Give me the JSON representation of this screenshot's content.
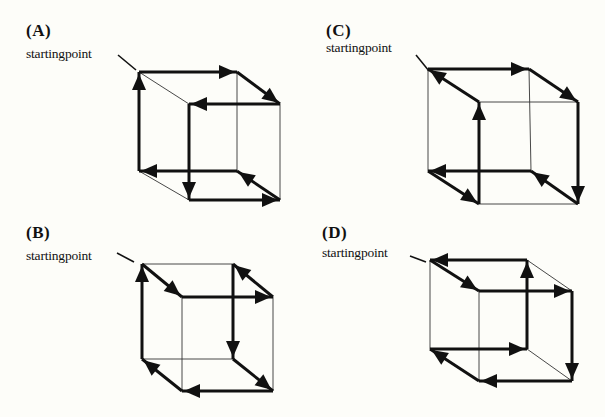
{
  "panels": [
    {
      "id": "A",
      "label": "(A)",
      "start_text": "startingpoint",
      "label_pos": [
        26,
        22
      ],
      "start_pos": [
        26,
        47
      ],
      "pointer": [
        [
          118,
          55
        ],
        [
          136,
          70
        ]
      ],
      "vertices": {
        "BTL": [
          139,
          72
        ],
        "BTR": [
          237,
          72
        ],
        "FTL": [
          189,
          104
        ],
        "FTR": [
          280,
          104
        ],
        "BBL": [
          139,
          171
        ],
        "BBR": [
          237,
          171
        ],
        "FBL": [
          189,
          200
        ],
        "FBR": [
          280,
          200
        ]
      },
      "path": [
        "BTL",
        "BTR",
        "FTR",
        "FTL",
        "FBL",
        "FBR",
        "BBR",
        "BBL",
        "BTL"
      ],
      "thin_edges": [
        [
          "BTL",
          "FTL"
        ],
        [
          "BTR",
          "BBR"
        ],
        [
          "FTR",
          "FBR"
        ],
        [
          "BBL",
          "FBL"
        ]
      ]
    },
    {
      "id": "B",
      "label": "(B)",
      "start_text": "startingpoint",
      "label_pos": [
        26,
        224
      ],
      "start_pos": [
        26,
        249
      ],
      "pointer": [
        [
          117,
          253
        ],
        [
          134,
          262
        ]
      ],
      "vertices": {
        "BTL": [
          142,
          264
        ],
        "BTR": [
          233,
          264
        ],
        "FTL": [
          182,
          297
        ],
        "FTR": [
          273,
          297
        ],
        "BBL": [
          142,
          359
        ],
        "BBR": [
          233,
          359
        ],
        "FBL": [
          182,
          391
        ],
        "FBR": [
          273,
          391
        ]
      },
      "path": [
        "BTL",
        "FTL",
        "FTR",
        "BTR",
        "BBR",
        "FBR",
        "FBL",
        "BBL",
        "BTL"
      ],
      "thin_edges": [
        [
          "BTL",
          "BTR"
        ],
        [
          "FTL",
          "FBL"
        ],
        [
          "FTR",
          "FBR"
        ],
        [
          "BBL",
          "BBR"
        ]
      ]
    },
    {
      "id": "C",
      "label": "(C)",
      "start_text": "startingpoint",
      "label_pos": [
        326,
        22
      ],
      "start_pos": [
        326,
        41
      ],
      "pointer": [
        [
          416,
          55
        ],
        [
          429,
          71
        ]
      ],
      "vertices": {
        "BTL": [
          428,
          69
        ],
        "BTR": [
          529,
          69
        ],
        "FTL": [
          479,
          102
        ],
        "FTR": [
          578,
          102
        ],
        "BBL": [
          428,
          171
        ],
        "BBR": [
          531,
          171
        ],
        "FBL": [
          479,
          204
        ],
        "FBR": [
          578,
          204
        ]
      },
      "path": [
        "BTL",
        "BTR",
        "FTR",
        "FBR",
        "BBR",
        "BBL",
        "FBL",
        "FTL",
        "BTL"
      ],
      "thin_edges": [
        [
          "FTL",
          "FTR"
        ],
        [
          "BTL",
          "BBL"
        ],
        [
          "BTR",
          "BBR"
        ],
        [
          "FBL",
          "FBR"
        ]
      ]
    },
    {
      "id": "D",
      "label": "(D)",
      "start_text": "startingpoint",
      "label_pos": [
        322,
        224
      ],
      "start_pos": [
        322,
        246
      ],
      "pointer": [
        [
          410,
          256
        ],
        [
          426,
          262
        ]
      ],
      "vertices": {
        "BTL": [
          430,
          260
        ],
        "BTR": [
          527,
          260
        ],
        "FTL": [
          479,
          291
        ],
        "FTR": [
          572,
          291
        ],
        "BBL": [
          430,
          349
        ],
        "BBR": [
          527,
          349
        ],
        "FBL": [
          479,
          381
        ],
        "FBR": [
          572,
          381
        ]
      },
      "path": [
        "BTL",
        "FTL",
        "FTR",
        "FBR",
        "FBL",
        "BBL",
        "BBR",
        "BTR",
        "BTL"
      ],
      "thin_edges": [
        [
          "BTR",
          "FTR"
        ],
        [
          "BTL",
          "BBL"
        ],
        [
          "FTL",
          "FBL"
        ],
        [
          "BBR",
          "FBR"
        ]
      ]
    }
  ]
}
